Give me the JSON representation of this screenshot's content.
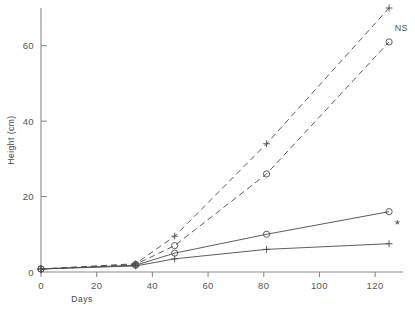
{
  "chart_data": {
    "type": "line",
    "title": "",
    "xlabel": "Days",
    "ylabel": "Height  (cm)",
    "xlim": [
      0,
      130
    ],
    "ylim": [
      0,
      70
    ],
    "xticks": [
      0,
      20,
      40,
      60,
      80,
      100,
      120
    ],
    "xtick_labels": [
      "0",
      "20",
      "40",
      "60",
      "80",
      "100",
      "120"
    ],
    "yticks": [
      0,
      20,
      40,
      60
    ],
    "ytick_labels": [
      "0",
      "20",
      "40",
      "60"
    ],
    "grid": false,
    "legend": "none",
    "x": [
      0,
      34,
      48,
      81,
      125
    ],
    "series": [
      {
        "name": "dashed-plus",
        "marker": "+",
        "linestyle": "dashed",
        "values": [
          0.8,
          2.2,
          9.5,
          34.0,
          70.0
        ],
        "end_annotation": "NS"
      },
      {
        "name": "dashed-circle",
        "marker": "o",
        "linestyle": "dashed",
        "values": [
          0.8,
          2.0,
          7.0,
          26.0,
          61.0
        ],
        "end_annotation": ""
      },
      {
        "name": "solid-circle",
        "marker": "o",
        "linestyle": "solid",
        "values": [
          0.8,
          1.8,
          5.0,
          10.0,
          16.0
        ],
        "end_annotation": "*"
      },
      {
        "name": "solid-plus",
        "marker": "+",
        "linestyle": "solid",
        "values": [
          0.8,
          1.6,
          3.5,
          6.0,
          7.5
        ],
        "end_annotation": ""
      }
    ],
    "annotations": [
      {
        "text": "NS",
        "x": 127,
        "y": 64
      },
      {
        "text": "*",
        "x": 127,
        "y": 11.5
      }
    ]
  }
}
